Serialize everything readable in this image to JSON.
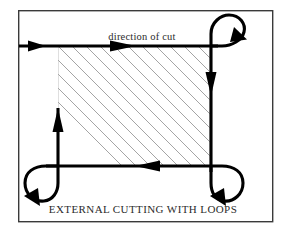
{
  "figure": {
    "title_caption": "EXTERNAL CUTTING WITH LOOPS",
    "direction_label": "direction of cut",
    "frame": {
      "x": 18,
      "y": 10,
      "width": 255,
      "height": 212,
      "stroke_color": "#3a3a3a"
    },
    "workpiece": {
      "name": "hatched-workpiece",
      "x": 58,
      "y": 46,
      "width": 152,
      "height": 120,
      "hatch_angle_degrees": 45,
      "hatch_spacing_px": 14,
      "hatch_color": "#9a9a9a"
    },
    "toolpath": {
      "stroke_color": "#000000",
      "stroke_width": 3.1,
      "entry_side": "left",
      "travel_order": [
        "enter-from-left",
        "top-edge-rightward",
        "top-right-loop",
        "right-edge-downward",
        "bottom-right-loop",
        "bottom-edge-leftward",
        "bottom-left-loop",
        "left-edge-upward"
      ],
      "corner_loops": [
        {
          "name": "top-right-loop",
          "center_x": 226,
          "center_y": 32,
          "radius": 16,
          "sweep": "clockwise"
        },
        {
          "name": "bottom-right-loop",
          "center_x": 228,
          "center_y": 182,
          "radius": 17,
          "sweep": "clockwise"
        },
        {
          "name": "bottom-left-loop",
          "center_x": 40,
          "center_y": 182,
          "radius": 17,
          "sweep": "counterclockwise"
        }
      ],
      "arrow_markers": [
        {
          "name": "entry-arrow",
          "x": 40,
          "y": 46,
          "direction": "right"
        },
        {
          "name": "top-edge-arrow",
          "x": 123,
          "y": 46,
          "direction": "right"
        },
        {
          "name": "top-right-loop-arrow",
          "x": 238,
          "y": 38,
          "direction": "down-right"
        },
        {
          "name": "right-edge-arrow",
          "x": 210,
          "y": 78,
          "direction": "down"
        },
        {
          "name": "bottom-right-loop-arrow",
          "x": 219,
          "y": 196,
          "direction": "down-left"
        },
        {
          "name": "bottom-edge-arrow",
          "x": 155,
          "y": 166,
          "direction": "left"
        },
        {
          "name": "bottom-left-loop-arrow",
          "x": 33,
          "y": 196,
          "direction": "down-left"
        },
        {
          "name": "left-edge-arrow",
          "x": 59,
          "y": 112,
          "direction": "up"
        }
      ]
    },
    "colors": {
      "background": "#ffffff",
      "line": "#000000",
      "frame": "#3a3a3a",
      "hatch": "#9a9a9a",
      "text": "#2b2b2b"
    }
  }
}
